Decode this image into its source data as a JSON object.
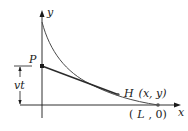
{
  "diagram": {
    "type": "pursuit-curve",
    "labels": {
      "y_axis": "y",
      "x_axis": "x",
      "point_p": "P",
      "dimension": "vt",
      "point_h_name": "H",
      "point_h_coords": "(x, y)",
      "point_l_open": "(",
      "point_l_name": "L",
      "point_l_rest": ", 0)"
    },
    "colors": {
      "stroke": "#1a1a1a",
      "curve": "#4a4a4a",
      "tangent": "#2a2a2a",
      "background": "#ffffff"
    }
  }
}
